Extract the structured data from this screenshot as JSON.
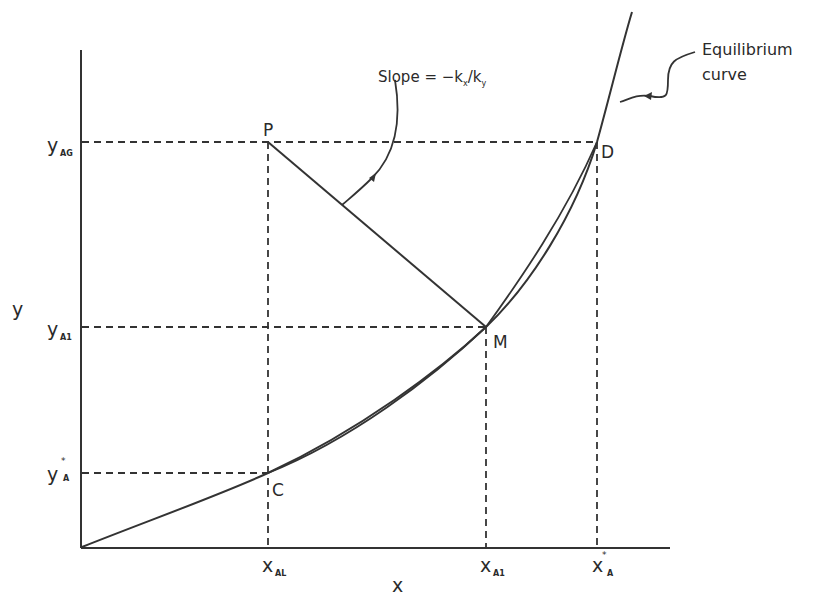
{
  "diagram": {
    "axes": {
      "x_label": "x",
      "y_label": "y"
    },
    "points": [
      {
        "name": "P",
        "label": "P"
      },
      {
        "name": "M",
        "label": "M"
      },
      {
        "name": "C",
        "label": "C"
      },
      {
        "name": "D",
        "label": "D"
      }
    ],
    "y_ticks": [
      {
        "base": "y",
        "sub": "AG",
        "sup": ""
      },
      {
        "base": "y",
        "sub": "A1",
        "sup": ""
      },
      {
        "base": "y",
        "sub": "A",
        "sup": "*"
      }
    ],
    "x_ticks": [
      {
        "base": "x",
        "sub": "AL",
        "sup": ""
      },
      {
        "base": "x",
        "sub": "A1",
        "sup": ""
      },
      {
        "base": "x",
        "sub": "A",
        "sup": "*"
      }
    ],
    "annotations": {
      "slope_label": "Slope = −k",
      "slope_sub1": "x",
      "slope_mid": "/k",
      "slope_sub2": "y",
      "curve_label_line1": "Equilibrium",
      "curve_label_line2": "curve"
    }
  }
}
